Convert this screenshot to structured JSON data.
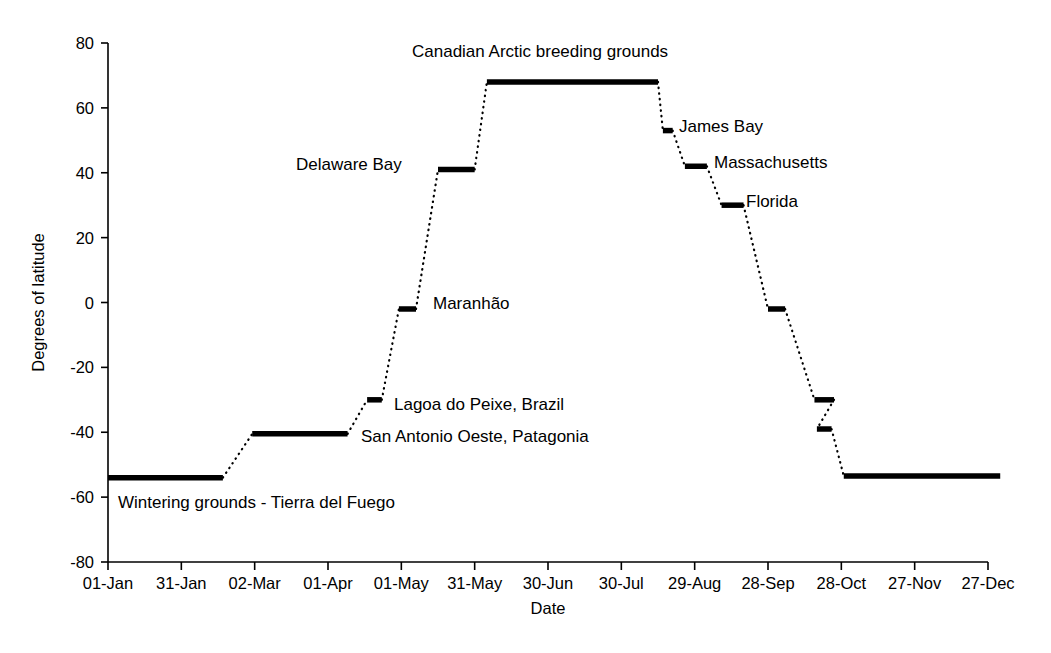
{
  "chart_data": {
    "type": "line",
    "title": "",
    "xlabel": "Date",
    "ylabel": "Degrees of latitude",
    "ylim": [
      -80,
      80
    ],
    "ytick_values": [
      80,
      60,
      40,
      20,
      0,
      -20,
      -40,
      -60,
      -80
    ],
    "ytick_labels": [
      "80",
      "60",
      "40",
      "20",
      "0",
      "-20",
      "-40",
      "-60",
      "-80"
    ],
    "xtick_labels": [
      "01-Jan",
      "31-Jan",
      "02-Mar",
      "01-Apr",
      "01-May",
      "31-May",
      "30-Jun",
      "30-Jul",
      "29-Aug",
      "28-Sep",
      "28-Oct",
      "27-Nov",
      "27-Dec"
    ],
    "xtick_days": [
      0,
      30,
      60,
      90,
      120,
      150,
      180,
      210,
      240,
      270,
      300,
      330,
      360
    ],
    "grid": false,
    "legend": "none",
    "series": [
      {
        "name": "Red knot annual migration latitude",
        "description": "Stepwise latitude of a migrating shorebird through the year; solid horizontal bars are stopover/residency plateaus, dotted segments are migratory flights.",
        "stops": [
          {
            "name": "Wintering grounds - Tierra del Fuego",
            "latitude": -54,
            "start_day": 0,
            "end_day": 47
          },
          {
            "name": "San Antonio Oeste, Patagonia",
            "latitude": -40.5,
            "start_day": 59,
            "end_day": 98
          },
          {
            "name": "Lagoa do Peixe, Brazil",
            "latitude": -30,
            "start_day": 106,
            "end_day": 112
          },
          {
            "name": "Maranhao",
            "latitude": -2,
            "start_day": 119,
            "end_day": 126
          },
          {
            "name": "Delaware Bay",
            "latitude": 41,
            "start_day": 135,
            "end_day": 150
          },
          {
            "name": "Canadian Arctic breeding grounds",
            "latitude": 68,
            "start_day": 155,
            "end_day": 225
          },
          {
            "name": "James Bay",
            "latitude": 53,
            "start_day": 227,
            "end_day": 231
          },
          {
            "name": "Massachusetts",
            "latitude": 42,
            "start_day": 236,
            "end_day": 245
          },
          {
            "name": "Florida",
            "latitude": 30,
            "start_day": 251,
            "end_day": 260
          },
          {
            "name": "Maranhao (southbound)",
            "latitude": -2,
            "start_day": 270,
            "end_day": 277
          },
          {
            "name": "Lagoa do Peixe (southbound)",
            "latitude": -30,
            "start_day": 289,
            "end_day": 297
          },
          {
            "name": "San Antonio Oeste (southbound)",
            "latitude": -39,
            "start_day": 290,
            "end_day": 296
          },
          {
            "name": "Wintering grounds - Tierra del Fuego (return)",
            "latitude": -53.5,
            "start_day": 301,
            "end_day": 365
          }
        ]
      }
    ],
    "annotations": [
      {
        "text": "Canadian Arctic breeding grounds",
        "x": 412,
        "y": 57,
        "anchor": "start"
      },
      {
        "text": "James Bay",
        "x": 679,
        "y": 132,
        "anchor": "start"
      },
      {
        "text": "Delaware Bay",
        "x": 296,
        "y": 170,
        "anchor": "start"
      },
      {
        "text": "Massachusetts",
        "x": 714,
        "y": 168,
        "anchor": "start"
      },
      {
        "text": "Florida",
        "x": 746,
        "y": 207,
        "anchor": "start"
      },
      {
        "text": "Maranhão",
        "x": 433,
        "y": 309,
        "anchor": "start"
      },
      {
        "text": "Lagoa do Peixe, Brazil",
        "x": 394,
        "y": 410,
        "anchor": "start"
      },
      {
        "text": "San Antonio Oeste, Patagonia",
        "x": 361,
        "y": 442,
        "anchor": "start"
      },
      {
        "text": "Wintering grounds - Tierra del Fuego",
        "x": 118,
        "y": 508,
        "anchor": "start"
      }
    ]
  },
  "geometry": {
    "plot_left": 108,
    "plot_right": 988,
    "y_top_px": 43,
    "y_bottom_px": 562,
    "y_top_val": 80,
    "y_bottom_val": -80
  }
}
